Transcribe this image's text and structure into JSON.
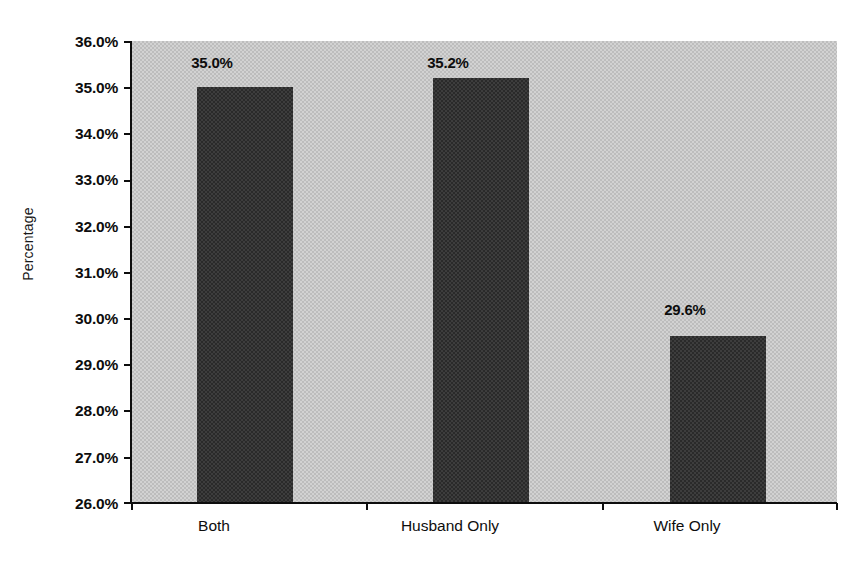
{
  "chart_data": {
    "type": "bar",
    "title": "",
    "subtitle": "",
    "xlabel": "",
    "ylabel": "Percentage",
    "categories": [
      "Both",
      "Husband Only",
      "Wife Only"
    ],
    "values": [
      35.0,
      35.2,
      29.6
    ],
    "value_labels": [
      "35.0%",
      "35.2%",
      "29.6%"
    ],
    "ylim": [
      26.0,
      36.0
    ],
    "ytick_values": [
      26.0,
      27.0,
      28.0,
      29.0,
      30.0,
      31.0,
      32.0,
      33.0,
      34.0,
      35.0,
      36.0
    ],
    "ytick_labels": [
      "26.0%",
      "27.0%",
      "28.0%",
      "29.0%",
      "30.0%",
      "31.0%",
      "32.0%",
      "33.0%",
      "34.0%",
      "35.0%",
      "36.0%"
    ],
    "grid": false,
    "legend": false,
    "legend_position": "none",
    "series": [
      {
        "name": "Percentage",
        "values": [
          35.0,
          35.2,
          29.6
        ]
      }
    ],
    "colors": {
      "bar_fill": "#3d3d3d",
      "plot_background": "#d2d2d2",
      "axis": "#0d0d0d",
      "text": "#0d0d0d",
      "page_background": "#ffffff"
    }
  }
}
